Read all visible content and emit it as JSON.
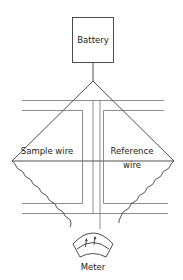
{
  "diagram": {
    "type": "bridge-circuit",
    "components": {
      "battery": {
        "label": "Battery"
      },
      "sample_wire": {
        "label": "Sample wire"
      },
      "reference_wire": {
        "label_line1": "Reference",
        "label_line2": "wire"
      },
      "meter": {
        "label": "Meter"
      }
    },
    "colors": {
      "line": "#6f6f6f",
      "dark_line": "#3a3a3a",
      "text": "#1a1a1a",
      "background": "#ffffff"
    }
  }
}
